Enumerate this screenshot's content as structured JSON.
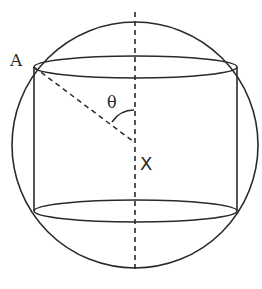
{
  "diagram": {
    "labels": {
      "point_a": "A",
      "center": "X",
      "angle": "θ"
    },
    "colors": {
      "stroke": "#2a2a2a",
      "background": "#ffffff"
    },
    "elements": [
      {
        "name": "sphere",
        "type": "circle"
      },
      {
        "name": "cylinder-top-ellipse",
        "type": "ellipse"
      },
      {
        "name": "cylinder-bottom-ellipse",
        "type": "ellipse"
      },
      {
        "name": "cylinder-left-side",
        "type": "line"
      },
      {
        "name": "cylinder-right-side",
        "type": "line"
      },
      {
        "name": "vertical-axis",
        "type": "dashed-line"
      },
      {
        "name": "radius-to-a",
        "type": "dashed-line"
      },
      {
        "name": "angle-arc",
        "type": "arc"
      }
    ]
  }
}
